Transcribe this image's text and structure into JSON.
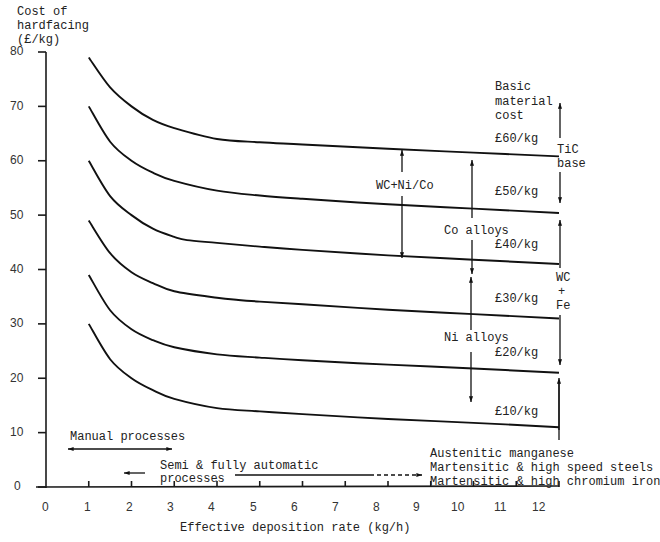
{
  "chart_data": {
    "type": "line",
    "title": "",
    "ylabel": [
      "Cost of",
      "hardfacing",
      "(£/kg)"
    ],
    "xlabel": "Effective deposition rate (kg/h)",
    "xlim": [
      0,
      12
    ],
    "ylim": [
      0,
      80
    ],
    "x_ticks": [
      "0",
      "1",
      "2",
      "3",
      "4",
      "5",
      "6",
      "7",
      "8",
      "9",
      "10",
      "11",
      "12"
    ],
    "y_ticks": [
      "80",
      "70",
      "60",
      "50",
      "40",
      "30",
      "20",
      "10",
      "0"
    ],
    "grid": false,
    "legend_heading": [
      "Basic",
      "material",
      "cost"
    ],
    "series": [
      {
        "name": "£60/kg",
        "x": [
          1,
          1.5,
          2,
          2.5,
          3,
          4,
          5,
          6,
          8,
          10,
          12
        ],
        "values": [
          79,
          73.5,
          70,
          67.5,
          66,
          64,
          63.4,
          63,
          62.2,
          61.5,
          60.8
        ]
      },
      {
        "name": "£50/kg",
        "x": [
          1,
          1.5,
          2,
          2.5,
          3,
          4,
          5,
          6,
          8,
          10,
          12
        ],
        "values": [
          70,
          63.5,
          60,
          57.8,
          56.3,
          54.5,
          53.6,
          53,
          52,
          51.2,
          50.4
        ]
      },
      {
        "name": "£40/kg",
        "x": [
          1,
          1.5,
          2,
          2.5,
          3,
          3.3,
          4,
          5,
          6,
          8,
          10,
          12
        ],
        "values": [
          60,
          53.5,
          50,
          47.5,
          46,
          45.4,
          44.9,
          44.2,
          43.6,
          42.6,
          41.8,
          41
        ]
      },
      {
        "name": "£30/kg",
        "x": [
          1,
          1.5,
          2,
          2.5,
          3,
          4,
          4.5,
          5,
          6,
          8,
          10,
          12
        ],
        "values": [
          49,
          43,
          39.5,
          37.5,
          36,
          34.8,
          34.4,
          34.1,
          33.6,
          32.6,
          31.8,
          31
        ]
      },
      {
        "name": "£20/kg",
        "x": [
          1,
          1.5,
          2,
          2.5,
          3,
          4,
          5,
          6,
          8,
          10,
          12
        ],
        "values": [
          39,
          32.5,
          29,
          27,
          25.7,
          24.4,
          23.8,
          23.3,
          22.5,
          21.8,
          21
        ]
      },
      {
        "name": "£10/kg",
        "x": [
          1,
          1.5,
          2,
          2.5,
          3,
          4,
          5,
          6,
          8,
          10,
          12
        ],
        "values": [
          30,
          23.5,
          20,
          17.8,
          16.2,
          14.5,
          13.9,
          13.4,
          12.5,
          11.8,
          11
        ]
      }
    ],
    "annotations": [
      {
        "text": "WC+Ni/Co",
        "x": 7.6,
        "y": 54
      },
      {
        "text": "Co alloys",
        "x": 9.3,
        "y": 45.5
      },
      {
        "text": "Ni alloys",
        "x": 9.3,
        "y": 25.5
      },
      {
        "text": "TiC base",
        "side": "right",
        "range": [
          50,
          66
        ]
      },
      {
        "text": "WC + Fe",
        "side": "right",
        "range": [
          22,
          50
        ]
      },
      {
        "text": "Manual processes",
        "range_x": [
          0.5,
          3
        ]
      },
      {
        "text": "Semi & fully automatic processes",
        "range_x": [
          2,
          9
        ]
      },
      {
        "text": "Austenitic manganese"
      },
      {
        "text": "Martensitic & high speed steels"
      },
      {
        "text": "Martensitic & high chromium iron"
      }
    ]
  },
  "labels": {
    "ylabel_1": "Cost of",
    "ylabel_2": "hardfacing",
    "ylabel_3": "(£/kg)",
    "xlabel": "Effective deposition rate (kg/h)",
    "legend_1": "Basic",
    "legend_2": "material",
    "legend_3": "cost",
    "cost_60": "£60/kg",
    "cost_50": "£50/kg",
    "cost_40": "£40/kg",
    "cost_30": "£30/kg",
    "cost_20": "£20/kg",
    "cost_10": "£10/kg",
    "wc_nico": "WC+Ni/Co",
    "co_alloys": "Co alloys",
    "ni_alloys": "Ni alloys",
    "tic_1": "TiC",
    "tic_2": "base",
    "wcfe_1": "WC",
    "wcfe_2": "+",
    "wcfe_3": "Fe",
    "manual": "Manual processes",
    "semi_1": "Semi & fully automatic",
    "semi_2": "processes",
    "mat_1": "Austenitic manganese",
    "mat_2": "Martensitic & high speed steels",
    "mat_3": "Martensitic & high chromium iron",
    "y": [
      "80",
      "70",
      "60",
      "50",
      "40",
      "30",
      "20",
      "10",
      "0"
    ],
    "x": [
      "0",
      "1",
      "2",
      "3",
      "4",
      "5",
      "6",
      "7",
      "8",
      "9",
      "10",
      "11",
      "12"
    ]
  }
}
